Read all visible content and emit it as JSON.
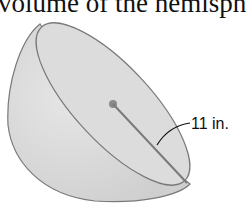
{
  "heading": {
    "text": "volume of the hemisph"
  },
  "figure": {
    "shape": "hemisphere",
    "radius_label": "11 in.",
    "fill_color": "#d9d9d9",
    "outline_color": "#7a7a7a"
  }
}
